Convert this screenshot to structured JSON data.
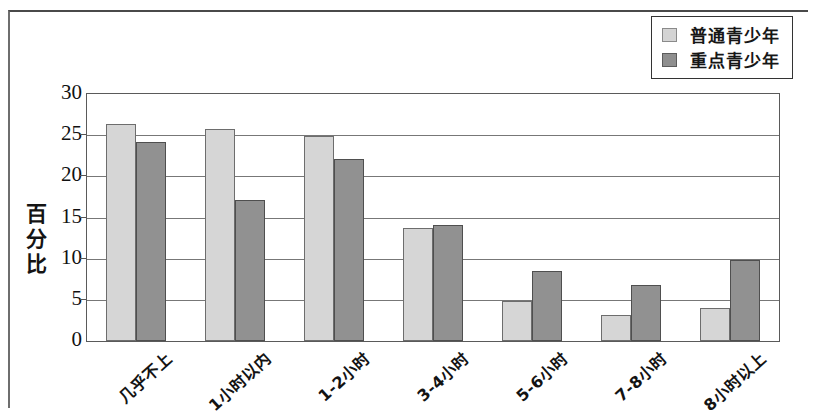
{
  "chart_data": {
    "type": "bar",
    "title": "",
    "xlabel": "",
    "ylabel": "百分比",
    "ylim": [
      0,
      30
    ],
    "yticks": [
      0,
      5,
      10,
      15,
      20,
      25,
      30
    ],
    "grid": true,
    "legend_position": "top-right",
    "categories": [
      "几乎不上",
      "1小时以内",
      "1-2小时",
      "3-4小时",
      "5-6小时",
      "7-8小时",
      "8小时以上"
    ],
    "series": [
      {
        "name": "普通青少年",
        "color": "#d6d6d6",
        "values": [
          26.3,
          25.7,
          24.9,
          13.7,
          4.8,
          3.2,
          4.0
        ]
      },
      {
        "name": "重点青少年",
        "color": "#919191",
        "values": [
          24.2,
          17.1,
          22.1,
          14.1,
          8.5,
          6.8,
          9.9
        ]
      }
    ]
  },
  "legend": {
    "items": [
      {
        "label": "普通青少年",
        "swatch": "light-gray-swatch"
      },
      {
        "label": "重点青少年",
        "swatch": "dark-gray-swatch"
      }
    ]
  }
}
